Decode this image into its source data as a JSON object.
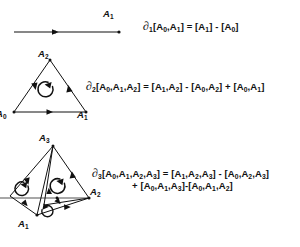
{
  "figure": {
    "background_color": "#ffffff",
    "ink_color": "#111111",
    "muted_edge_color": "#8a8a8a"
  },
  "equations": {
    "d1": {
      "operator": "∂",
      "operator_subscript": "1",
      "text": "∂₁[A₀,A₁] = [A₁] - [A₀]",
      "lhs_args": "[A₀,A₁]",
      "rhs_terms": [
        "[A₁]",
        "- [A₀]"
      ]
    },
    "d2": {
      "operator": "∂",
      "operator_subscript": "2",
      "text": "∂₂[A₀,A₁,A₂] = [A₁,A₂] - [A₀,A₂] + [A₀,A₁]",
      "lhs_args": "[A₀,A₁,A₂]",
      "rhs_terms": [
        "[A₁,A₂]",
        "- [A₀,A₂]",
        "+ [A₀,A₁]"
      ]
    },
    "d3": {
      "operator": "∂",
      "operator_subscript": "3",
      "line1": "∂₃[A₀,A₁,A₂,A₃] = [A₁,A₂,A₃] - [A₀,A₂,A₃]",
      "line2": "+ [A₀,A₁,A₃]-[A₀,A₁,A₂]",
      "lhs_args": "[A₀,A₁,A₂,A₃]",
      "rhs_terms": [
        "[A₁,A₂,A₃]",
        "- [A₀,A₂,A₃]",
        "+ [A₀,A₁,A₃]",
        "-[A₀,A₁,A₂]"
      ]
    }
  },
  "diagrams": {
    "simplex1": {
      "name": "1-simplex segment",
      "vertex_labels": [
        "A₁"
      ],
      "label_a1": "A",
      "label_a1_sub": "1"
    },
    "simplex2": {
      "name": "2-simplex triangle",
      "label_a2": "A",
      "label_a2_sub": "2",
      "label_a1": "A",
      "label_a1_sub": "1",
      "label_a0": "A",
      "label_a0_sub": "0",
      "orientation": "counterclockwise"
    },
    "simplex3": {
      "name": "3-simplex tetrahedron",
      "label_a3": "A",
      "label_a3_sub": "3",
      "label_a2": "A",
      "label_a2_sub": "2",
      "label_a1": "A",
      "label_a1_sub": "1",
      "orientation": "counterclockwise"
    }
  }
}
